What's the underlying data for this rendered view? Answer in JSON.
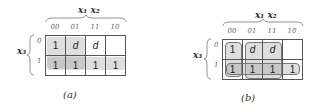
{
  "maps": [
    {
      "id": "a",
      "caption": "(a)",
      "top_variable": "x₁ x₂",
      "left_variable": "x₃",
      "column_labels": [
        "00",
        "01",
        "11",
        "10"
      ],
      "row_labels": [
        "0",
        "1"
      ],
      "cells": [
        [
          "1",
          "d",
          "d",
          ""
        ],
        [
          "1",
          "1",
          "1",
          "1"
        ]
      ],
      "groupings": [
        "row x3=1 (all four cells)",
        "columns 00,01 in row 0"
      ]
    },
    {
      "id": "b",
      "caption": "(b)",
      "top_variable": "x₁ x₂",
      "left_variable": "x₃",
      "column_labels": [
        "00",
        "01",
        "11",
        "10"
      ],
      "row_labels": [
        "0",
        "1"
      ],
      "cells": [
        [
          "1",
          "d",
          "d",
          ""
        ],
        [
          "1",
          "1",
          "1",
          "1"
        ]
      ],
      "groupings": [
        "row x3=1 (all four cells)",
        "column 00 rows 0-1",
        "columns 01,11 rows 0-1"
      ]
    }
  ]
}
